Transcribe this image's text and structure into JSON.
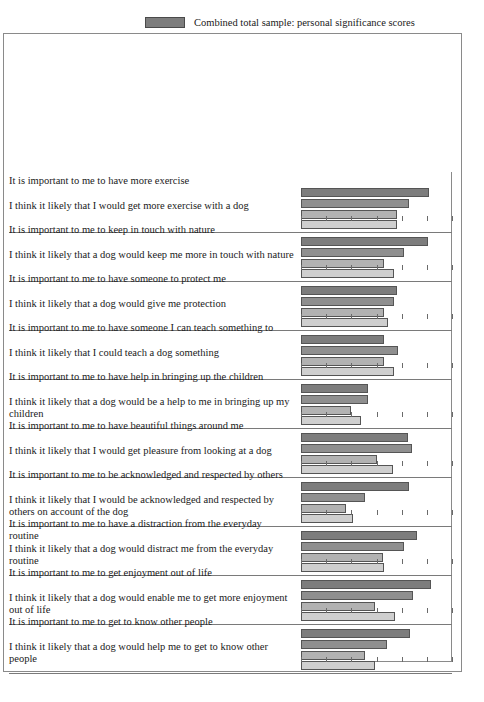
{
  "legend": {
    "entries": [
      {
        "label": "Combined total sample: personal significance scores",
        "color": "#7d7d7d",
        "name": "legend-combined-total-sample"
      },
      {
        "label": "Respondents with dog in household",
        "color": "#8f8f8f",
        "name": "legend-dog-in-household"
      },
      {
        "label": "Respondents with other pets in household",
        "color": "#b2b2b2",
        "name": "legend-other-pets-in-household"
      },
      {
        "label": "Respondents with no pets in household",
        "color": "#cfcfcf",
        "name": "legend-no-pets-in-household"
      }
    ],
    "brace_text_line1": "Perceived likelihood",
    "brace_text_line2": "of incidence"
  },
  "axis": {
    "title_line1": "Scale of personal significance",
    "title_line2": "or perceived likelihood",
    "ticks": [
      "0",
      "1",
      "2",
      "3",
      "4",
      "5",
      "6"
    ],
    "min": 0,
    "max": 6
  },
  "chart_data": {
    "type": "bar",
    "orientation": "horizontal",
    "title": "Scale of personal significance or perceived likelihood",
    "xlabel": "Scale of personal significance or perceived likelihood",
    "ylabel": "",
    "xlim": [
      0,
      6
    ],
    "grid": true,
    "legend_position": "top",
    "series": [
      {
        "name": "Combined total sample: personal significance scores",
        "color": "#7d7d7d"
      },
      {
        "name": "Respondents with dog in household",
        "color": "#8f8f8f"
      },
      {
        "name": "Respondents with other pets in household",
        "color": "#b2b2b2"
      },
      {
        "name": "Respondents with no pets in household",
        "color": "#cfcfcf"
      }
    ],
    "categories": [
      "It is important to me to have more exercise",
      "I think it likely that I would get more exercise with a dog",
      "It is important to me to keep in touch with nature",
      "I think it likely that a dog would keep me more in touch with nature",
      "It is important to me to have someone to protect me",
      "I think it likely that a dog would give me protection",
      "It is important to me to have someone I can teach something to",
      "I think it likely that I could teach a dog something",
      "It is important to me to have help in bringing up the children",
      "I think it likely that a dog would be a help to me in bringing up my children",
      "It is important to me to have beautiful things around me",
      "I think it likely that I would get pleasure from looking at a dog",
      "It is important to me to be acknowledged and respected by others",
      "I think it likely that I would be acknowledged and respected by others on account of the dog",
      "It is important to me to have a distraction from the everyday routine",
      "I think it likely that a dog would distract me from the everyday routine",
      "It is important to me to get enjoyment out of life",
      "I think it likely that a dog would enable me to get more enjoyment out of life",
      "It is important to me to get to know other people",
      "I think it likely that a dog would help me to get to know other people"
    ],
    "groups": [
      {
        "significance_label": "It is important to me to have more exercise",
        "likelihood_label": "I think it likely that I would get more exercise with a dog",
        "values": [
          5.1,
          4.3,
          3.8,
          3.8
        ]
      },
      {
        "significance_label": "It is important to me to keep in touch with nature",
        "likelihood_label": "I think it likely that a dog would keep me more in touch with nature",
        "values": [
          5.05,
          4.1,
          3.3,
          3.7
        ]
      },
      {
        "significance_label": "It is important to me to have someone to protect me",
        "likelihood_label": "I think it likely that a dog would give me protection",
        "values": [
          3.8,
          3.7,
          3.3,
          3.45
        ]
      },
      {
        "significance_label": "It is important to me to have someone I can teach something to",
        "likelihood_label": "I think it likely that I could teach a dog something",
        "values": [
          3.3,
          3.85,
          3.3,
          3.7
        ]
      },
      {
        "significance_label": "It is important to me to have help in bringing up the children",
        "likelihood_label": "I think it likely that a dog would be a help to me in bringing up my children",
        "values": [
          2.65,
          2.65,
          2.0,
          2.4
        ]
      },
      {
        "significance_label": "It is important to me to have beautiful things around me",
        "likelihood_label": "I think it likely that I would get pleasure from looking at a dog",
        "values": [
          4.25,
          4.4,
          3.0,
          3.65
        ]
      },
      {
        "significance_label": "It is important to me to be acknowledged and respected by others",
        "likelihood_label": "I think it likely that I would be acknowledged and respected by others on account of the dog",
        "values": [
          4.3,
          2.55,
          1.8,
          2.05
        ]
      },
      {
        "significance_label": "It is important to me to have a distraction from the everyday routine",
        "likelihood_label": "I think it likely that a dog would distract me from the everyday routine",
        "values": [
          4.6,
          4.1,
          3.25,
          3.3
        ]
      },
      {
        "significance_label": "It is important to me to get enjoyment out of life",
        "likelihood_label": "I think it likely that a dog would enable me to get more enjoyment out of life",
        "values": [
          5.15,
          4.45,
          2.95,
          3.75
        ]
      },
      {
        "significance_label": "It is important to me to get to know other people",
        "likelihood_label": "I think it likely that a dog would help me to get to know other people",
        "values": [
          4.35,
          3.4,
          2.55,
          2.95
        ]
      }
    ]
  }
}
